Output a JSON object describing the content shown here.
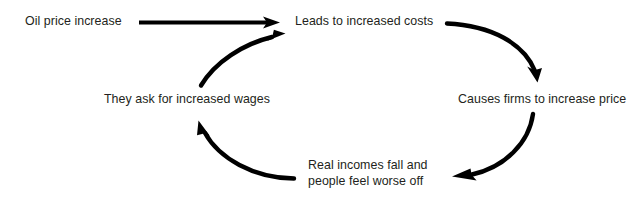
{
  "diagram": {
    "type": "cycle-flow",
    "background_color": "#ffffff",
    "text_color": "#231f20",
    "arrow_color": "#000000",
    "nodes": [
      {
        "id": "oil-price-increase",
        "label": "Oil price increase",
        "lines": [
          "Oil price increase"
        ]
      },
      {
        "id": "leads-to-increased-costs",
        "label": "Leads to increased costs",
        "lines": [
          "Leads to increased costs"
        ]
      },
      {
        "id": "causes-firms-to-increase-price",
        "label": "Causes firms to increase price",
        "lines": [
          "Causes firms to increase price"
        ]
      },
      {
        "id": "real-incomes-fall",
        "label": "Real incomes fall and people feel worse off",
        "lines": [
          "Real incomes fall and",
          "people feel worse off"
        ]
      },
      {
        "id": "they-ask-for-increased-wages",
        "label": "They ask for increased wages",
        "lines": [
          "They ask for increased wages"
        ]
      }
    ],
    "arrows": [
      {
        "id": "arrow-oil-to-costs",
        "from": "oil-price-increase",
        "to": "leads-to-increased-costs",
        "style": "straight"
      },
      {
        "id": "arrow-costs-to-firms",
        "from": "leads-to-increased-costs",
        "to": "causes-firms-to-increase-price",
        "style": "curved"
      },
      {
        "id": "arrow-firms-to-real-incomes",
        "from": "causes-firms-to-increase-price",
        "to": "real-incomes-fall",
        "style": "curved"
      },
      {
        "id": "arrow-real-incomes-to-wages",
        "from": "real-incomes-fall",
        "to": "they-ask-for-increased-wages",
        "style": "curved"
      },
      {
        "id": "arrow-wages-to-costs",
        "from": "they-ask-for-increased-wages",
        "to": "leads-to-increased-costs",
        "style": "curved"
      }
    ]
  }
}
